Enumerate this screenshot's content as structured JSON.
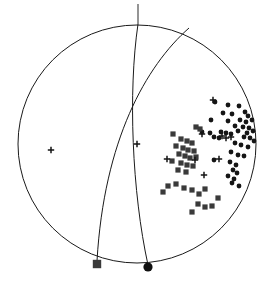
{
  "figure": {
    "name": "focal-mechanism-stereonet",
    "background_color": "#ffffff",
    "line_color": "#1a1a1a"
  },
  "projection": {
    "center_x": 137,
    "center_y": 144,
    "radius": 119,
    "primitive_circle_label": "primitive-circle"
  },
  "north_tick": {
    "x": 138,
    "y_top": 4,
    "y_bottom": 24
  },
  "chart_data": {
    "type": "scatter",
    "title": "",
    "subtitle": "",
    "xlabel": "",
    "ylabel": "",
    "xlim": [
      18,
      256
    ],
    "ylim": [
      25,
      263
    ],
    "grid": false,
    "legend": "none",
    "marker_types": [
      "dot",
      "square",
      "cross"
    ],
    "marker_colors": {
      "dot": "#151515",
      "square": "#3a3a3a",
      "cross": "#151515"
    },
    "marker_sizes": {
      "dot": 2.4,
      "square": 2.6,
      "cross": 3.2
    },
    "series": [
      {
        "name": "compressional-first-motion",
        "marker": "dot",
        "count": 43,
        "points": [
          [
            215,
            102
          ],
          [
            228,
            105
          ],
          [
            239,
            106
          ],
          [
            245,
            112
          ],
          [
            223,
            113
          ],
          [
            232,
            114
          ],
          [
            248,
            116
          ],
          [
            211,
            120
          ],
          [
            228,
            121
          ],
          [
            240,
            120
          ],
          [
            246,
            122
          ],
          [
            252,
            120
          ],
          [
            235,
            126
          ],
          [
            243,
            127
          ],
          [
            249,
            128
          ],
          [
            238,
            131
          ],
          [
            247,
            133
          ],
          [
            253,
            131
          ],
          [
            202,
            132
          ],
          [
            210,
            133
          ],
          [
            221,
            132
          ],
          [
            226,
            133
          ],
          [
            231,
            134
          ],
          [
            214,
            137
          ],
          [
            219,
            138
          ],
          [
            244,
            137
          ],
          [
            250,
            138
          ],
          [
            254,
            141
          ],
          [
            235,
            143
          ],
          [
            241,
            145
          ],
          [
            248,
            147
          ],
          [
            231,
            152
          ],
          [
            238,
            155
          ],
          [
            244,
            156
          ],
          [
            214,
            160
          ],
          [
            230,
            162
          ],
          [
            236,
            165
          ],
          [
            233,
            170
          ],
          [
            237,
            173
          ],
          [
            228,
            176
          ],
          [
            234,
            179
          ],
          [
            232,
            183
          ],
          [
            239,
            186
          ]
        ]
      },
      {
        "name": "dilatational-first-motion",
        "marker": "square",
        "count": 32,
        "points": [
          [
            196,
            127
          ],
          [
            200,
            129
          ],
          [
            173,
            134
          ],
          [
            181,
            139
          ],
          [
            187,
            141
          ],
          [
            192,
            143
          ],
          [
            176,
            146
          ],
          [
            183,
            148
          ],
          [
            188,
            150
          ],
          [
            194,
            151
          ],
          [
            179,
            154
          ],
          [
            185,
            156
          ],
          [
            190,
            158
          ],
          [
            196,
            157
          ],
          [
            172,
            161
          ],
          [
            181,
            163
          ],
          [
            187,
            165
          ],
          [
            193,
            166
          ],
          [
            178,
            170
          ],
          [
            186,
            172
          ],
          [
            168,
            186
          ],
          [
            176,
            184
          ],
          [
            184,
            188
          ],
          [
            163,
            192
          ],
          [
            192,
            190
          ],
          [
            199,
            194
          ],
          [
            205,
            189
          ],
          [
            198,
            204
          ],
          [
            205,
            207
          ],
          [
            192,
            212
          ],
          [
            212,
            206
          ],
          [
            218,
            198
          ]
        ]
      },
      {
        "name": "nodal-or-emergent-arrival",
        "marker": "cross",
        "count": 11,
        "points": [
          [
            51,
            150
          ],
          [
            137,
            144
          ],
          [
            213,
            100
          ],
          [
            202,
            134
          ],
          [
            222,
            136
          ],
          [
            226,
            138
          ],
          [
            231,
            137
          ],
          [
            167,
            159
          ],
          [
            195,
            160
          ],
          [
            219,
            159
          ],
          [
            204,
            175
          ]
        ]
      }
    ],
    "axis_markers": [
      {
        "name": "p-axis",
        "marker": "square-large",
        "x": 97,
        "y": 264,
        "size": 4.2,
        "color": "#3a3a3a"
      },
      {
        "name": "t-axis",
        "marker": "circle-large",
        "x": 148,
        "y": 267,
        "size": 4.6,
        "color": "#101010"
      }
    ],
    "nodal_planes": [
      {
        "name": "nodal-plane-1",
        "path": "M 189,28 C 147,63 107,135 97,261",
        "description": "plane from upper area curving down to lower-left bottom"
      },
      {
        "name": "nodal-plane-2",
        "path": "M 138,24 C 130,90 133,190 148,265",
        "description": "plane from north point curving down to bottom center"
      }
    ]
  }
}
